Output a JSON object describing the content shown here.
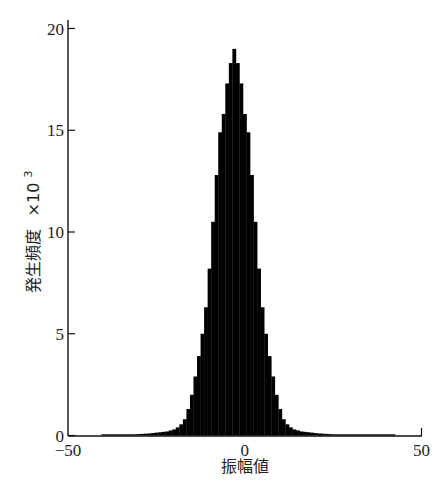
{
  "chart_data": {
    "type": "bar",
    "title": "",
    "xlabel": "振幅値",
    "ylabel": "発生頻度 ×10³",
    "ylabel_main": "発生頻度",
    "ylabel_multiplier": "×10",
    "ylabel_exponent": "3",
    "xlim": [
      -50,
      50
    ],
    "ylim": [
      0,
      20
    ],
    "xticks": [
      -50,
      0,
      50
    ],
    "yticks": [
      0,
      5,
      10,
      15,
      20
    ],
    "grid": false,
    "legend": null,
    "bar_color": "#000000",
    "bin_width": 1,
    "peak_center": 1,
    "bins": [
      -40,
      -39,
      -38,
      -37,
      -36,
      -35,
      -34,
      -33,
      -32,
      -31,
      -30,
      -29,
      -28,
      -27,
      -26,
      -25,
      -24,
      -23,
      -22,
      -21,
      -20,
      -19,
      -18,
      -17,
      -16,
      -15,
      -14,
      -13,
      -12,
      -11,
      -10,
      -9,
      -8,
      -7,
      -6,
      -5,
      -4,
      -3,
      -2,
      -1,
      0,
      1,
      2,
      3,
      4,
      5,
      6,
      7,
      8,
      9,
      10,
      11,
      12,
      13,
      14,
      15,
      16,
      17,
      18,
      19,
      20,
      21,
      22,
      23,
      24,
      25,
      26,
      27,
      28,
      29,
      30,
      31,
      32,
      33,
      34,
      35,
      36,
      37,
      38,
      39,
      40,
      41,
      42
    ],
    "values": [
      0.01,
      0.01,
      0.02,
      0.02,
      0.03,
      0.03,
      0.04,
      0.05,
      0.05,
      0.06,
      0.07,
      0.08,
      0.09,
      0.1,
      0.12,
      0.14,
      0.16,
      0.18,
      0.2,
      0.25,
      0.3,
      0.4,
      0.55,
      0.8,
      1.3,
      2.0,
      2.9,
      3.9,
      5.0,
      6.3,
      8.2,
      10.5,
      12.8,
      14.9,
      15.8,
      17.3,
      18.3,
      19.0,
      18.3,
      17.3,
      15.8,
      14.9,
      12.8,
      10.5,
      8.2,
      6.3,
      5.0,
      3.9,
      2.9,
      2.0,
      1.3,
      0.8,
      0.55,
      0.4,
      0.3,
      0.25,
      0.2,
      0.18,
      0.16,
      0.14,
      0.12,
      0.1,
      0.09,
      0.08,
      0.07,
      0.06,
      0.05,
      0.05,
      0.04,
      0.03,
      0.03,
      0.02,
      0.02,
      0.01,
      0.01,
      0.01,
      0.01,
      0.01,
      0.01,
      0.01,
      0.01,
      0.01,
      0.01
    ]
  }
}
